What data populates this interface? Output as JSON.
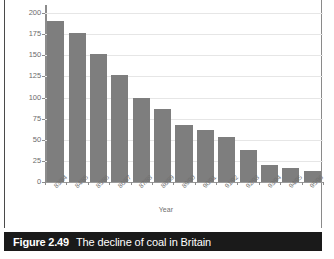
{
  "figure": {
    "caption_number": "Figure 2.49",
    "caption_title": "The decline of coal in Britain"
  },
  "chart_data": {
    "type": "bar",
    "title": "The decline of coal in Britain",
    "xlabel": "Year",
    "ylabel": "",
    "ylim": [
      0,
      200
    ],
    "yticks": [
      0,
      25,
      50,
      75,
      100,
      125,
      150,
      175,
      200
    ],
    "grid": true,
    "legend": null,
    "bar_color": "#7e7e7e",
    "gridline_color": "#e6e6e6",
    "axis_color": "#8c8c8c",
    "categories": [
      "83/84",
      "84/85",
      "85/86",
      "86/87",
      "87/88",
      "88/89",
      "89/90",
      "90/91",
      "91/92",
      "92/93",
      "93/94",
      "94/95",
      "95/96"
    ],
    "values": [
      191,
      176,
      151,
      127,
      100,
      87,
      68,
      61,
      53,
      38,
      20,
      16,
      13
    ]
  }
}
